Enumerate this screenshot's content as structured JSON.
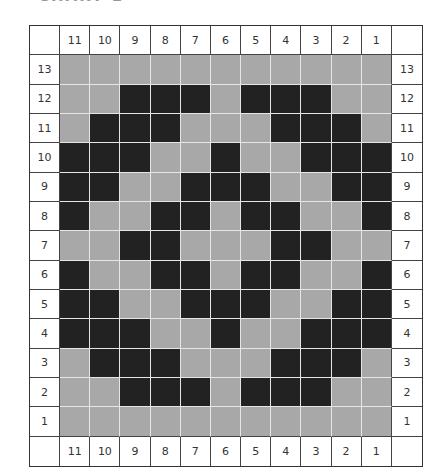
{
  "title": "CHART 1",
  "colors": {
    "background": "#a8a8a8",
    "filled": "#222222",
    "gridline": "#e6e6e6",
    "border": "#333333"
  },
  "chart_data": {
    "type": "heatmap",
    "title": "CHART 1",
    "columns": [
      11,
      10,
      9,
      8,
      7,
      6,
      5,
      4,
      3,
      2,
      1
    ],
    "rows": [
      13,
      12,
      11,
      10,
      9,
      8,
      7,
      6,
      5,
      4,
      3,
      2,
      1
    ],
    "legend": {
      "0": "light gray",
      "1": "black"
    },
    "grid": [
      [
        0,
        0,
        0,
        0,
        0,
        0,
        0,
        0,
        0,
        0,
        0
      ],
      [
        0,
        0,
        1,
        1,
        1,
        0,
        1,
        1,
        1,
        0,
        0
      ],
      [
        0,
        1,
        1,
        1,
        0,
        0,
        0,
        1,
        1,
        1,
        0
      ],
      [
        1,
        1,
        1,
        0,
        0,
        1,
        0,
        0,
        1,
        1,
        1
      ],
      [
        1,
        1,
        0,
        0,
        1,
        1,
        1,
        0,
        0,
        1,
        1
      ],
      [
        1,
        0,
        0,
        1,
        1,
        0,
        1,
        1,
        0,
        0,
        1
      ],
      [
        0,
        0,
        1,
        1,
        0,
        0,
        0,
        1,
        1,
        0,
        0
      ],
      [
        1,
        0,
        0,
        1,
        1,
        0,
        1,
        1,
        0,
        0,
        1
      ],
      [
        1,
        1,
        0,
        0,
        1,
        1,
        1,
        0,
        0,
        1,
        1
      ],
      [
        1,
        1,
        1,
        0,
        0,
        1,
        0,
        0,
        1,
        1,
        1
      ],
      [
        0,
        1,
        1,
        1,
        0,
        0,
        0,
        1,
        1,
        1,
        0
      ],
      [
        0,
        0,
        1,
        1,
        1,
        0,
        1,
        1,
        1,
        0,
        0
      ],
      [
        0,
        0,
        0,
        0,
        0,
        0,
        0,
        0,
        0,
        0,
        0
      ]
    ]
  }
}
